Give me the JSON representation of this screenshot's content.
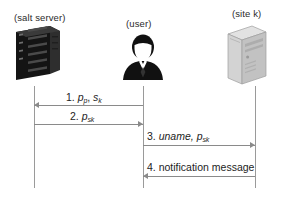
{
  "diagram": {
    "type": "sequence-diagram",
    "background_color": "#ffffff",
    "line_color": "#8a8a8a",
    "text_color": "#1d1d1d"
  },
  "actors": [
    {
      "id": "salt-server",
      "label": "(salt server)",
      "icon": "server-rack-icon",
      "icon_color": "#1a1a1a",
      "lifeline_x": 34
    },
    {
      "id": "user",
      "label": "(user)",
      "icon": "user-person-icon",
      "icon_color": "#111111",
      "lifeline_x": 143
    },
    {
      "id": "site-k",
      "label": "(site k)",
      "icon": "desktop-tower-icon",
      "icon_color": "#c9c9c9",
      "lifeline_x": 255
    }
  ],
  "messages": [
    {
      "number": "1.",
      "label_plain": "1. pp, sk",
      "body": "p",
      "body_sub": "p",
      "body2": "s",
      "body2_sub": "k",
      "from": "user",
      "to": "salt-server",
      "direction": "left"
    },
    {
      "number": "2.",
      "label_plain": "2. psk",
      "body": "p",
      "body_sub": "sk",
      "from": "salt-server",
      "to": "user",
      "direction": "right"
    },
    {
      "number": "3.",
      "label_plain": "3. uname, psk",
      "body": "uname,",
      "body2": "p",
      "body2_sub": "sk",
      "from": "user",
      "to": "site-k",
      "direction": "right"
    },
    {
      "number": "4.",
      "label_plain": "4. notification message",
      "body": "notification message",
      "from": "site-k",
      "to": "user",
      "direction": "left"
    }
  ]
}
